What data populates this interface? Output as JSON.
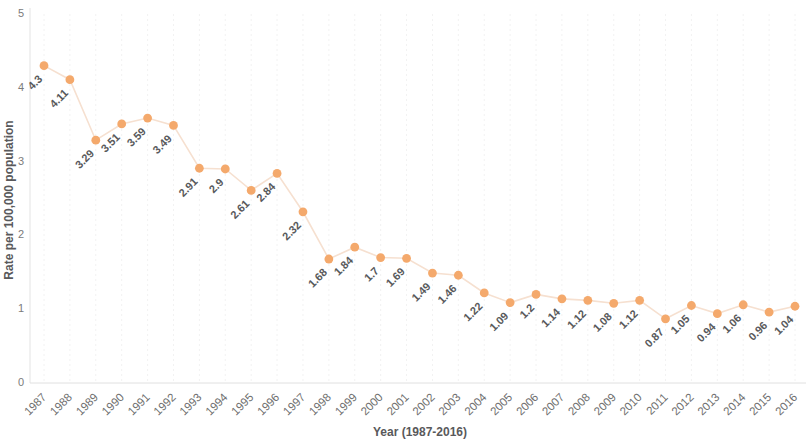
{
  "chart_data": {
    "type": "line",
    "title": "",
    "xlabel": "Year (1987-2016)",
    "ylabel": "Rate per 100,000 population",
    "categories": [
      "1987",
      "1988",
      "1989",
      "1990",
      "1991",
      "1992",
      "1993",
      "1994",
      "1995",
      "1996",
      "1997",
      "1998",
      "1999",
      "2000",
      "2001",
      "2002",
      "2003",
      "2004",
      "2005",
      "2006",
      "2007",
      "2008",
      "2009",
      "2010",
      "2011",
      "2012",
      "2013",
      "2014",
      "2015",
      "2016"
    ],
    "values": [
      4.3,
      4.11,
      3.29,
      3.51,
      3.59,
      3.49,
      2.91,
      2.9,
      2.61,
      2.84,
      2.32,
      1.68,
      1.84,
      1.7,
      1.69,
      1.49,
      1.46,
      1.22,
      1.09,
      1.2,
      1.14,
      1.12,
      1.08,
      1.12,
      0.87,
      1.05,
      0.94,
      1.06,
      0.96,
      1.04
    ],
    "data_labels": [
      "4.3",
      "4.11",
      "3.29",
      "3.51",
      "3.59",
      "3.49",
      "2.91",
      "2.9",
      "2.61",
      "2.84",
      "2.32",
      "1.68",
      "1.84",
      "1.7",
      "1.69",
      "1.49",
      "1.46",
      "1.22",
      "1.09",
      "1.2",
      "1.14",
      "1.12",
      "1.08",
      "1.12",
      "0.87",
      "1.05",
      "0.94",
      "1.06",
      "0.96",
      "1.04"
    ],
    "ylim": [
      0,
      5
    ],
    "yticks": [
      0,
      1,
      2,
      3,
      4,
      5
    ],
    "ytick_labels": [
      "0",
      "1",
      "2",
      "3",
      "4",
      "5"
    ],
    "xlim_labels": [
      "1987",
      "2016"
    ],
    "grid": "vertical-dotted",
    "legend": "none",
    "marker_color": "#f4a96c",
    "line_color": "#f6e0d0",
    "label_color": "#58595b",
    "axis_color": "#e3e3e3",
    "background": "#ffffff",
    "label_rotation_deg": -45,
    "xtick_rotation_deg": -45
  }
}
